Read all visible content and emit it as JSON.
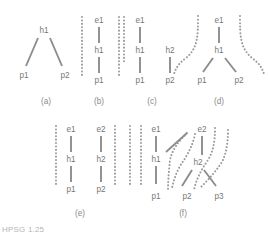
{
  "figure": {
    "colors": {
      "background": "#ffffff",
      "text": "#777777",
      "solid_edge": "#8d8d8d",
      "dotted_edge": "#9a9a9a",
      "caption": "#9c9c9c"
    },
    "caption_fragment": "HPSG 1.25",
    "panels": [
      {
        "id": "a",
        "label": "(a)",
        "label_x": 46,
        "label_y": 102,
        "nodes": [
          {
            "text": "h1",
            "x": 44,
            "y": 31
          },
          {
            "text": "p1",
            "x": 24,
            "y": 76
          },
          {
            "text": "p2",
            "x": 65,
            "y": 76
          }
        ],
        "solid_edges": [
          {
            "x1": 38,
            "y1": 38,
            "x2": 26,
            "y2": 66
          },
          {
            "x1": 50,
            "y1": 38,
            "x2": 62,
            "y2": 66
          }
        ],
        "dotted_edges": []
      },
      {
        "id": "b",
        "label": "(b)",
        "label_x": 99,
        "label_y": 102,
        "nodes": [
          {
            "text": "e1",
            "x": 99,
            "y": 21
          },
          {
            "text": "h1",
            "x": 99,
            "y": 51
          },
          {
            "text": "p1",
            "x": 99,
            "y": 81
          }
        ],
        "solid_edges": [
          {
            "x1": 99,
            "y1": 27,
            "x2": 99,
            "y2": 43
          },
          {
            "x1": 99,
            "y1": 57,
            "x2": 99,
            "y2": 73
          }
        ],
        "dotted_edges": [
          {
            "x1": 82,
            "y1": 17,
            "x2": 82,
            "y2": 78
          },
          {
            "x1": 119,
            "y1": 17,
            "x2": 119,
            "y2": 78
          }
        ]
      },
      {
        "id": "c",
        "label": "(c)",
        "label_x": 152,
        "label_y": 102,
        "nodes": [
          {
            "text": "e1",
            "x": 140,
            "y": 21
          },
          {
            "text": "h1",
            "x": 140,
            "y": 51
          },
          {
            "text": "h2",
            "x": 170,
            "y": 51
          },
          {
            "text": "p1",
            "x": 140,
            "y": 81
          },
          {
            "text": "p2",
            "x": 170,
            "y": 81
          }
        ],
        "solid_edges": [
          {
            "x1": 140,
            "y1": 27,
            "x2": 140,
            "y2": 43
          },
          {
            "x1": 140,
            "y1": 57,
            "x2": 140,
            "y2": 73
          },
          {
            "x1": 170,
            "y1": 57,
            "x2": 170,
            "y2": 73
          }
        ],
        "dotted_edges": [
          {
            "x1": 124,
            "y1": 17,
            "x2": 124,
            "y2": 64
          }
        ]
      },
      {
        "id": "d",
        "label": "(d)",
        "label_x": 219,
        "label_y": 102,
        "nodes": [
          {
            "text": "e1",
            "x": 219,
            "y": 21
          },
          {
            "text": "h1",
            "x": 219,
            "y": 51
          },
          {
            "text": "p1",
            "x": 202,
            "y": 81
          },
          {
            "text": "p2",
            "x": 239,
            "y": 81
          }
        ],
        "solid_edges": [
          {
            "x1": 219,
            "y1": 27,
            "x2": 219,
            "y2": 43
          },
          {
            "x1": 213,
            "y1": 58,
            "x2": 203,
            "y2": 72
          },
          {
            "x1": 225,
            "y1": 58,
            "x2": 236,
            "y2": 72
          }
        ],
        "dotted_curves": [
          "M 198,16 C 198,36 198,48 186,58 C 178,64 176,68 174,74",
          "M 240,16 C 240,36 240,48 252,58 C 260,64 262,68 264,74"
        ]
      },
      {
        "id": "e",
        "label": "(e)",
        "label_x": 80,
        "label_y": 214,
        "nodes": [
          {
            "text": "e1",
            "x": 71,
            "y": 130
          },
          {
            "text": "e2",
            "x": 101,
            "y": 130
          },
          {
            "text": "h1",
            "x": 71,
            "y": 160
          },
          {
            "text": "h2",
            "x": 101,
            "y": 160
          },
          {
            "text": "p1",
            "x": 71,
            "y": 190
          },
          {
            "text": "p2",
            "x": 101,
            "y": 190
          }
        ],
        "solid_edges": [
          {
            "x1": 71,
            "y1": 136,
            "x2": 71,
            "y2": 152
          },
          {
            "x1": 101,
            "y1": 136,
            "x2": 101,
            "y2": 152
          },
          {
            "x1": 71,
            "y1": 166,
            "x2": 71,
            "y2": 182
          },
          {
            "x1": 101,
            "y1": 166,
            "x2": 101,
            "y2": 182
          }
        ],
        "dotted_edges": [
          {
            "x1": 56,
            "y1": 126,
            "x2": 56,
            "y2": 187
          },
          {
            "x1": 115,
            "y1": 126,
            "x2": 115,
            "y2": 187
          },
          {
            "x1": 130,
            "y1": 126,
            "x2": 130,
            "y2": 187
          }
        ]
      },
      {
        "id": "f",
        "label": "(f)",
        "label_x": 183,
        "label_y": 214,
        "nodes": [
          {
            "text": "e1",
            "x": 156,
            "y": 130
          },
          {
            "text": "e2",
            "x": 202,
            "y": 130
          },
          {
            "text": "h1",
            "x": 156,
            "y": 160
          },
          {
            "text": "h2",
            "x": 198,
            "y": 163
          },
          {
            "text": "p1",
            "x": 156,
            "y": 197
          },
          {
            "text": "p2",
            "x": 187,
            "y": 197
          },
          {
            "text": "p3",
            "x": 219,
            "y": 197
          }
        ],
        "solid_edges": [
          {
            "x1": 156,
            "y1": 136,
            "x2": 156,
            "y2": 152
          },
          {
            "x1": 156,
            "y1": 166,
            "x2": 156,
            "y2": 184
          },
          {
            "x1": 202,
            "y1": 136,
            "x2": 202,
            "y2": 155
          },
          {
            "x1": 166,
            "y1": 152,
            "x2": 187,
            "y2": 133
          },
          {
            "x1": 192,
            "y1": 170,
            "x2": 182,
            "y2": 186
          },
          {
            "x1": 204,
            "y1": 170,
            "x2": 216,
            "y2": 186
          }
        ],
        "dotted_edges": [
          {
            "x1": 141,
            "y1": 126,
            "x2": 141,
            "y2": 187
          }
        ],
        "dotted_curves": [
          "M 187,133 C 178,142 172,150 170,160 C 169,170 168,180 168,190",
          "M 195,134 C 193,144 189,152 184,160 C 178,168 174,178 172,188",
          "M 215,128 C 215,142 213,152 208,160 C 201,170 196,180 194,190",
          "M 228,130 C 228,144 226,154 222,162 C 214,174 206,182 200,188"
        ]
      }
    ]
  }
}
